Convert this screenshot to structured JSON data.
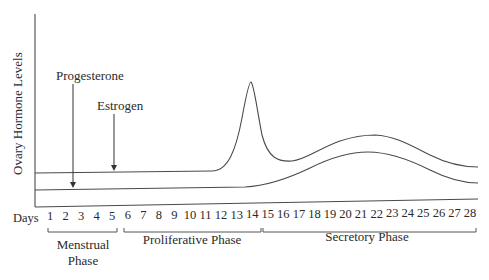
{
  "diagram": {
    "ylabel": "Ovary Hormone Levels",
    "xlabel": "Days",
    "days": [
      "1",
      "2",
      "3",
      "4",
      "5",
      "6",
      "7",
      "8",
      "9",
      "10",
      "11",
      "12",
      "13",
      "14",
      "15",
      "16",
      "17",
      "18",
      "19",
      "20",
      "21",
      "22",
      "23",
      "24",
      "25",
      "26",
      "27",
      "28"
    ],
    "annotations": {
      "progesterone": "Progesterone",
      "estrogen": "Estrogen"
    },
    "phases": [
      {
        "name_line1": "Menstrual",
        "name_line2": "Phase",
        "start_day": 1,
        "end_day": 5
      },
      {
        "name_line1": "Proliferative Phase",
        "name_line2": "",
        "start_day": 6,
        "end_day": 14
      },
      {
        "name_line1": "Secretory Phase",
        "name_line2": "",
        "start_day": 15,
        "end_day": 28
      }
    ],
    "series": [
      {
        "name": "Estrogen",
        "description": "low and flat through day ~11, sharp peak at day ~14, dip near day ~16, broad hump peaking around day ~21, then declining"
      },
      {
        "name": "Progesterone",
        "description": "low and flat through day ~14, rising to a broad hump peaking around day ~21, then declining"
      }
    ]
  }
}
